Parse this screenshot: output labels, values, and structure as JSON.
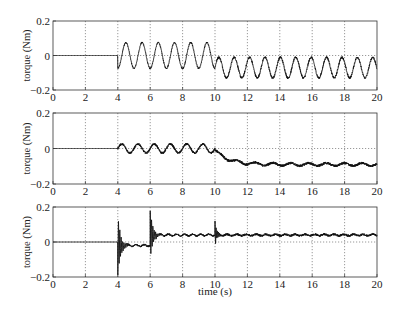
{
  "chart_data": [
    {
      "type": "line",
      "panel": "top",
      "title": "",
      "xlabel": "",
      "ylabel": "torque (Nm)",
      "xlim": [
        0,
        20
      ],
      "ylim": [
        -0.2,
        0.2
      ],
      "xticks": [
        "0",
        "2",
        "4",
        "6",
        "8",
        "10",
        "12",
        "14",
        "16",
        "18",
        "20"
      ],
      "yticks": [
        "0.2",
        "0",
        "-0.2"
      ],
      "grid": true,
      "series": [
        {
          "name": "torque",
          "segments": [
            {
              "t0": 0,
              "t1": 4,
              "offset": 0,
              "amplitude": 0,
              "period": 1,
              "noise": 0
            },
            {
              "t0": 4,
              "t1": 10,
              "offset": 0.0,
              "amplitude": 0.075,
              "period": 1.0,
              "noise": 0.004
            },
            {
              "t0": 10,
              "t1": 20,
              "offset": -0.07,
              "amplitude": 0.06,
              "period": 0.95,
              "noise": 0.006
            }
          ],
          "key_points": [
            [
              0,
              0
            ],
            [
              4,
              0
            ],
            [
              4.3,
              -0.07
            ],
            [
              4.75,
              0.075
            ],
            [
              5.2,
              -0.07
            ],
            [
              9.75,
              0.07
            ],
            [
              10.1,
              -0.12
            ],
            [
              10.6,
              0.0
            ],
            [
              11,
              -0.12
            ],
            [
              20,
              -0.08
            ]
          ]
        }
      ]
    },
    {
      "type": "line",
      "panel": "middle",
      "title": "",
      "xlabel": "",
      "ylabel": "torque (Nm)",
      "xlim": [
        0,
        20
      ],
      "ylim": [
        -0.2,
        0.2
      ],
      "xticks": [
        "0",
        "2",
        "4",
        "6",
        "8",
        "10",
        "12",
        "14",
        "16",
        "18",
        "20"
      ],
      "yticks": [
        "0.2",
        "0",
        "-0.2"
      ],
      "grid": true,
      "series": [
        {
          "name": "torque",
          "segments": [
            {
              "t0": 0,
              "t1": 4,
              "offset": 0,
              "amplitude": 0,
              "period": 1,
              "noise": 0
            },
            {
              "t0": 4,
              "t1": 10,
              "offset": 0.0,
              "amplitude": 0.025,
              "period": 1.0,
              "noise": 0.006
            },
            {
              "t0": 10,
              "t1": 20,
              "offset": -0.09,
              "amplitude": 0.008,
              "period": 1.1,
              "noise": 0.007
            }
          ],
          "key_points": [
            [
              0,
              0
            ],
            [
              4,
              0
            ],
            [
              4.1,
              -0.07
            ],
            [
              4.2,
              0.03
            ],
            [
              6,
              0.02
            ],
            [
              10,
              0.03
            ],
            [
              10.3,
              -0.04
            ],
            [
              11.5,
              -0.07
            ],
            [
              13,
              -0.09
            ],
            [
              20,
              -0.08
            ]
          ]
        }
      ]
    },
    {
      "type": "line",
      "panel": "bottom",
      "title": "",
      "xlabel": "time (s)",
      "ylabel": "torque (Nm)",
      "xlim": [
        0,
        20
      ],
      "ylim": [
        -0.2,
        0.2
      ],
      "xticks": [
        "0",
        "2",
        "4",
        "6",
        "8",
        "10",
        "12",
        "14",
        "16",
        "18",
        "20"
      ],
      "yticks": [
        "0.2",
        "0",
        "-0.2"
      ],
      "grid": true,
      "series": [
        {
          "name": "torque",
          "segments": [
            {
              "t0": 0,
              "t1": 4,
              "offset": 0,
              "amplitude": 0,
              "period": 1,
              "noise": 0
            },
            {
              "t0": 4,
              "t1": 6,
              "offset": -0.02,
              "amplitude": 0.005,
              "period": 0.5,
              "noise": 0.005
            },
            {
              "t0": 6,
              "t1": 10,
              "offset": 0.04,
              "amplitude": 0.005,
              "period": 0.5,
              "noise": 0.005
            },
            {
              "t0": 10,
              "t1": 20,
              "offset": 0.04,
              "amplitude": 0.004,
              "period": 0.6,
              "noise": 0.006
            }
          ],
          "transients": [
            {
              "t": 4.0,
              "amplitude": 0.17,
              "decay": 6,
              "freq": 12
            },
            {
              "t": 6.0,
              "amplitude": 0.14,
              "decay": 6,
              "freq": 12
            },
            {
              "t": 10.0,
              "amplitude": 0.08,
              "decay": 10,
              "freq": 14
            }
          ],
          "key_points": [
            [
              0,
              0
            ],
            [
              4,
              0
            ],
            [
              4.02,
              0.14
            ],
            [
              4.06,
              -0.17
            ],
            [
              4.5,
              -0.02
            ],
            [
              6,
              -0.02
            ],
            [
              6.02,
              -0.12
            ],
            [
              6.06,
              0.14
            ],
            [
              6.5,
              0.04
            ],
            [
              10,
              0.04
            ],
            [
              10.05,
              -0.04
            ],
            [
              20,
              0.04
            ]
          ]
        }
      ]
    }
  ],
  "figure": {
    "xlabel": "time (s)",
    "panel_ylabel": "torque (Nm)"
  }
}
